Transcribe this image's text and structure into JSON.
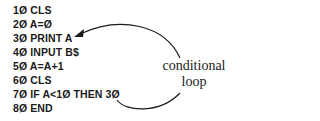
{
  "program": {
    "lines": [
      "1Ø CLS",
      "2Ø A=Ø",
      "3Ø PRINT A",
      "4Ø INPUT B$",
      "5Ø A=A+1",
      "6Ø CLS",
      "7Ø IF A<1Ø THEN 3Ø",
      "8Ø END"
    ]
  },
  "annotation": {
    "line1": "conditional",
    "line2": "loop"
  },
  "colors": {
    "ink": "#1a1a1a",
    "background": "#ffffff"
  }
}
